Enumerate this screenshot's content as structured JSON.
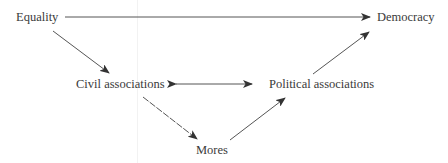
{
  "diagram": {
    "nodes": [
      {
        "id": "equality",
        "label": "Equality"
      },
      {
        "id": "democracy",
        "label": "Democracy"
      },
      {
        "id": "civil",
        "label": "Civil associations"
      },
      {
        "id": "political",
        "label": "Political associations"
      },
      {
        "id": "mores",
        "label": "Mores"
      }
    ],
    "edges": [
      {
        "from": "equality",
        "to": "democracy",
        "type": "directed"
      },
      {
        "from": "equality",
        "to": "civil",
        "type": "directed"
      },
      {
        "from": "civil",
        "to": "political",
        "type": "bidirectional"
      },
      {
        "from": "civil",
        "to": "mores",
        "type": "directed"
      },
      {
        "from": "mores",
        "to": "political",
        "type": "directed"
      },
      {
        "from": "political",
        "to": "democracy",
        "type": "directed"
      }
    ],
    "colors": {
      "text": "#3a3a3a",
      "arrow": "#444444",
      "background": "#ffffff"
    }
  }
}
